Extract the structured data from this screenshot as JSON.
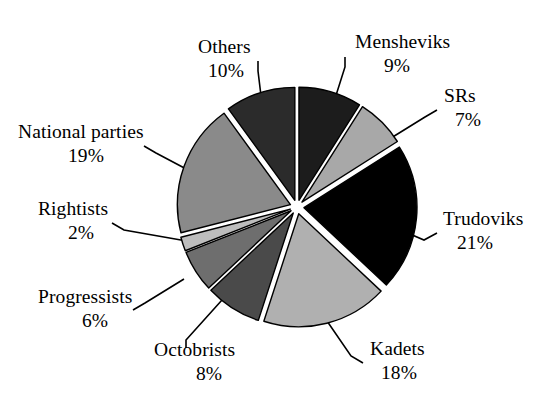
{
  "chart_data": {
    "type": "pie",
    "title": "",
    "subtitle": "",
    "xlabel": "",
    "ylabel": "",
    "legend_position": "none",
    "grid": false,
    "value_unit": "%",
    "total": 100,
    "start_angle_deg": 0,
    "direction": "clockwise",
    "exploded": true,
    "categories": [
      "Mensheviks",
      "SRs",
      "Trudoviks",
      "Kadets",
      "Octobrists",
      "Progressists",
      "Rightists",
      "National parties",
      "Others"
    ],
    "values": [
      9,
      7,
      21,
      18,
      8,
      6,
      2,
      19,
      10
    ],
    "colors": [
      "#1c1c1c",
      "#a8a8a8",
      "#000000",
      "#b0b0b0",
      "#4a4a4a",
      "#6e6e6e",
      "#bdbdbd",
      "#8a8a8a",
      "#2b2b2b"
    ],
    "slices": [
      {
        "label": "Mensheviks",
        "percent_text": "9%",
        "value": 9,
        "color": "#1c1c1c",
        "label_x": 355,
        "label_y": 48,
        "pct_x": 384,
        "pct_y": 72,
        "label_anchor": "start"
      },
      {
        "label": "SRs",
        "percent_text": "7%",
        "value": 7,
        "color": "#a8a8a8",
        "label_x": 444,
        "label_y": 102,
        "pct_x": 455,
        "pct_y": 126,
        "label_anchor": "start"
      },
      {
        "label": "Trudoviks",
        "percent_text": "21%",
        "value": 21,
        "color": "#000000",
        "label_x": 443,
        "label_y": 225,
        "pct_x": 457,
        "pct_y": 249,
        "label_anchor": "start"
      },
      {
        "label": "Kadets",
        "percent_text": "18%",
        "value": 18,
        "color": "#b0b0b0",
        "label_x": 370,
        "label_y": 355,
        "pct_x": 381,
        "pct_y": 379,
        "label_anchor": "start"
      },
      {
        "label": "Octobrists",
        "percent_text": "8%",
        "value": 8,
        "color": "#4a4a4a",
        "label_x": 154,
        "label_y": 356,
        "pct_x": 196,
        "pct_y": 380,
        "label_anchor": "start"
      },
      {
        "label": "Progressists",
        "percent_text": "6%",
        "value": 6,
        "color": "#6e6e6e",
        "label_x": 38,
        "label_y": 303,
        "pct_x": 82,
        "pct_y": 327,
        "label_anchor": "start"
      },
      {
        "label": "Rightists",
        "percent_text": "2%",
        "value": 2,
        "color": "#bdbdbd",
        "label_x": 38,
        "label_y": 215,
        "pct_x": 68,
        "pct_y": 239,
        "label_anchor": "start"
      },
      {
        "label": "National parties",
        "percent_text": "19%",
        "value": 19,
        "color": "#8a8a8a",
        "label_x": 18,
        "label_y": 138,
        "pct_x": 68,
        "pct_y": 162,
        "label_anchor": "start"
      },
      {
        "label": "Others",
        "percent_text": "10%",
        "value": 10,
        "color": "#2b2b2b",
        "label_x": 198,
        "label_y": 53,
        "pct_x": 208,
        "pct_y": 77,
        "label_anchor": "start"
      }
    ],
    "geometry": {
      "center_x": 297,
      "center_y": 207,
      "radius": 113,
      "explode_offset": 7,
      "stroke": "#000000",
      "stroke_width": 1.4,
      "background": "#ffffff"
    }
  }
}
